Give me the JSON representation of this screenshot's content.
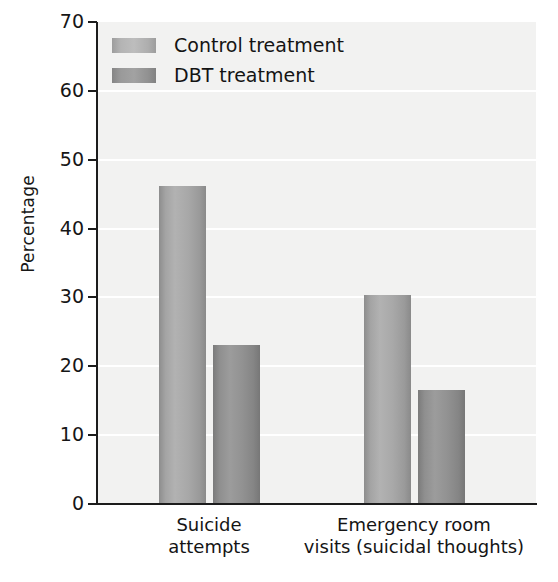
{
  "chart_data": {
    "type": "bar",
    "title": "",
    "subtitle": "",
    "xlabel": "",
    "ylabel": "Percentage",
    "ylim": [
      0,
      70
    ],
    "yticks": [
      0,
      10,
      20,
      30,
      40,
      50,
      60,
      70
    ],
    "ytick_labels": [
      "0",
      "10",
      "20",
      "30",
      "40",
      "50",
      "60",
      "70"
    ],
    "grid": true,
    "grid_axis": "y",
    "legend_position": "top-left",
    "categories": [
      "Suicide attempts",
      "Emergency room visits (suicidal thoughts)"
    ],
    "category_lines": [
      [
        "Suicide",
        "attempts"
      ],
      [
        "Emergency room",
        "visits (suicidal thoughts)"
      ]
    ],
    "series": [
      {
        "name": "Control treatment",
        "color": "#b0b0b0",
        "values": [
          46.2,
          30.3
        ]
      },
      {
        "name": "DBT treatment",
        "color": "#8f8f8f",
        "values": [
          23.1,
          16.5
        ]
      }
    ],
    "plot_background": "#f2f2f1",
    "gridline_color": "#ffffff",
    "axis_color": "#1c1c1c"
  },
  "legend": {
    "items": [
      {
        "label": "Control treatment",
        "swatch": "control"
      },
      {
        "label": "DBT treatment",
        "swatch": "dbt"
      }
    ]
  },
  "axis": {
    "y_title": "Percentage"
  }
}
